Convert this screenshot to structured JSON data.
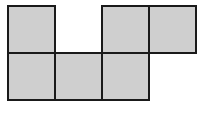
{
  "diagram": {
    "type": "polyomino",
    "grid": {
      "origin_x": 8,
      "origin_y": 6,
      "cell_size": 47,
      "rows": 2,
      "cols": 4
    },
    "colors": {
      "fill": "#cfcfcf",
      "stroke": "#1a1a1a",
      "background": "#ffffff"
    },
    "cells": [
      {
        "row": 0,
        "col": 0
      },
      {
        "row": 0,
        "col": 2
      },
      {
        "row": 0,
        "col": 3
      },
      {
        "row": 1,
        "col": 0
      },
      {
        "row": 1,
        "col": 1
      },
      {
        "row": 1,
        "col": 2
      }
    ]
  }
}
